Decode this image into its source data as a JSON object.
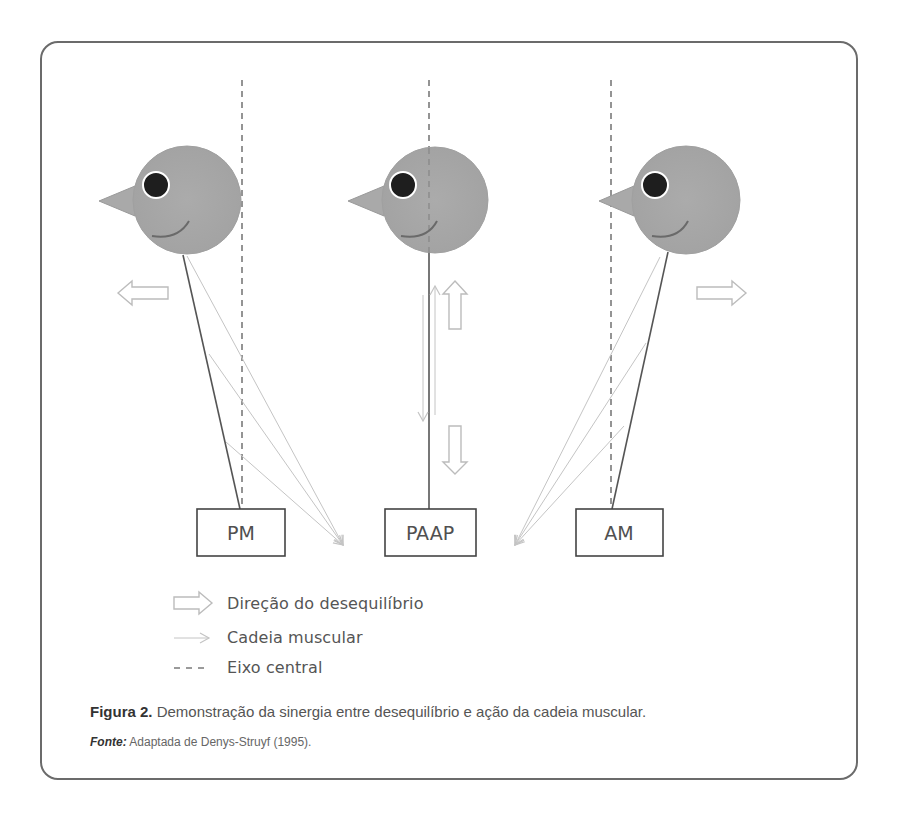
{
  "figure": {
    "panels": [
      {
        "id": "pm",
        "label": "PM",
        "balance": "posterior",
        "imbalance_direction": "left"
      },
      {
        "id": "paap",
        "label": "PAAP",
        "balance": "centered",
        "imbalance_direction": "up-down"
      },
      {
        "id": "am",
        "label": "AM",
        "balance": "anterior",
        "imbalance_direction": "right"
      }
    ],
    "legend": [
      {
        "icon": "block-arrow-icon",
        "label": "Direção do desequilíbrio"
      },
      {
        "icon": "thin-arrow-icon",
        "label": "Cadeia muscular"
      },
      {
        "icon": "dashed-line-icon",
        "label": "Eixo central"
      }
    ],
    "caption": {
      "prefix": "Figura 2.",
      "text": " Demonstração da sinergia entre desequilíbrio e ação da cadeia muscular."
    },
    "source": {
      "prefix": "Fonte:",
      "text": " Adaptada de Denys-Struyf (1995)."
    },
    "colors": {
      "frame": "#6b6b6b",
      "head_fill": "#a9a9a9",
      "eye": "#1e1e1e",
      "axis": "#7a7a7a",
      "chain": "#bdbdbd",
      "body_line": "#555555"
    }
  }
}
